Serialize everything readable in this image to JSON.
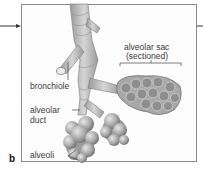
{
  "diagram": {
    "panel_letter": "b",
    "labels": {
      "alveolar_sac_line1": "alveolar sac",
      "alveolar_sac_line2": "(sectioned)",
      "bronchiole": "bronchiole",
      "alveolar_duct_line1": "alveolar",
      "alveolar_duct_line2": "duct",
      "alveoli": "alveoli"
    },
    "colors": {
      "frame": "#8a8a8a",
      "tissue": "#b8b8b8",
      "tissue_dark": "#8c8c8c",
      "text": "#3a3a3a"
    }
  }
}
